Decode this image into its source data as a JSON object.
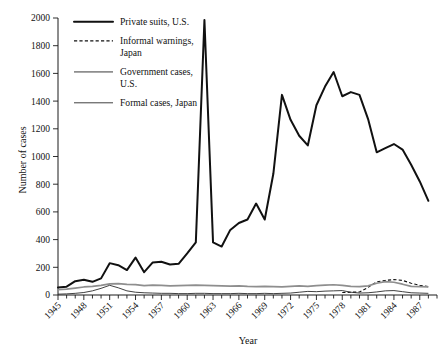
{
  "figure": {
    "background": "#ffffff",
    "ink": "#111111",
    "gray": "#8e8e8e"
  },
  "chart_data": {
    "type": "line",
    "title": "",
    "xlabel": "Year",
    "ylabel": "Number of cases",
    "xlim": [
      1945,
      1989
    ],
    "ylim": [
      0,
      2000
    ],
    "ytick_step": 200,
    "yticks": [
      0,
      200,
      400,
      600,
      800,
      1000,
      1200,
      1400,
      1600,
      1800,
      2000
    ],
    "xticks_major": [
      1945,
      1948,
      1951,
      1954,
      1957,
      1960,
      1963,
      1966,
      1969,
      1972,
      1975,
      1978,
      1981,
      1984,
      1987
    ],
    "xticks_minor_every": 1,
    "grid": false,
    "legend_position": "top-left-inside",
    "x": [
      1945,
      1946,
      1947,
      1948,
      1949,
      1950,
      1951,
      1952,
      1953,
      1954,
      1955,
      1956,
      1957,
      1958,
      1959,
      1960,
      1961,
      1962,
      1963,
      1964,
      1965,
      1966,
      1967,
      1968,
      1969,
      1970,
      1971,
      1972,
      1973,
      1974,
      1975,
      1976,
      1977,
      1978,
      1979,
      1980,
      1981,
      1982,
      1983,
      1984,
      1985,
      1986,
      1987,
      1988
    ],
    "series": [
      {
        "name": "Private suits, U.S.",
        "style": "solid-thick",
        "color": "#111111",
        "values": [
          55,
          60,
          100,
          110,
          95,
          120,
          230,
          215,
          180,
          270,
          165,
          235,
          240,
          220,
          225,
          300,
          380,
          1985,
          380,
          350,
          470,
          520,
          545,
          660,
          545,
          875,
          1445,
          1265,
          1150,
          1080,
          1370,
          1505,
          1610,
          1435,
          1465,
          1445,
          1270,
          1030,
          1060,
          1090,
          1050,
          940,
          820,
          680
        ]
      },
      {
        "name": "Informal warnings, Japan",
        "style": "dashed",
        "color": "#111111",
        "values": [
          0,
          0,
          0,
          0,
          0,
          0,
          0,
          0,
          0,
          0,
          0,
          0,
          0,
          0,
          0,
          0,
          0,
          0,
          0,
          0,
          0,
          0,
          0,
          0,
          0,
          0,
          0,
          0,
          0,
          0,
          0,
          0,
          0,
          18,
          20,
          22,
          55,
          95,
          105,
          112,
          105,
          85,
          70,
          60
        ]
      },
      {
        "name": "Government cases, U.S.",
        "style": "solid-gray",
        "color": "#8e8e8e",
        "values": [
          38,
          42,
          50,
          58,
          62,
          70,
          80,
          82,
          76,
          75,
          68,
          72,
          70,
          66,
          68,
          70,
          72,
          70,
          68,
          66,
          64,
          66,
          62,
          60,
          62,
          60,
          58,
          62,
          66,
          62,
          68,
          72,
          74,
          70,
          62,
          60,
          66,
          85,
          96,
          92,
          78,
          62,
          60,
          58
        ]
      },
      {
        "name": "Formal cases, Japan",
        "style": "solid-thin",
        "color": "#2b2b2b",
        "values": [
          6,
          8,
          12,
          18,
          30,
          48,
          70,
          52,
          30,
          20,
          16,
          14,
          12,
          12,
          10,
          10,
          12,
          12,
          10,
          10,
          10,
          12,
          10,
          10,
          12,
          10,
          12,
          14,
          20,
          26,
          24,
          28,
          30,
          32,
          20,
          14,
          16,
          22,
          30,
          32,
          24,
          16,
          14,
          12
        ]
      }
    ]
  },
  "legend": {
    "items": [
      {
        "label": "Private suits, U.S.",
        "style": "solid-thick"
      },
      {
        "label": "Informal warnings,",
        "label2": "Japan",
        "style": "dashed"
      },
      {
        "label": "Government cases,",
        "label2": "U.S.",
        "style": "solid-gray"
      },
      {
        "label": "Formal cases, Japan",
        "style": "solid-thin"
      }
    ]
  },
  "axes": {
    "y_title": "Number of cases",
    "x_title": "Year"
  }
}
